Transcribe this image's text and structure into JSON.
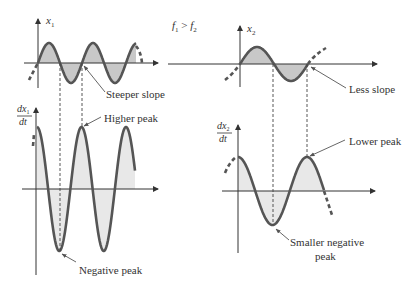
{
  "figure": {
    "condition": {
      "text_f1": "f",
      "sub1": "1",
      "op": " > ",
      "text_f2": "f",
      "sub2": "2"
    },
    "colors": {
      "curve": "#555555",
      "fill_top": "#c8c8c8",
      "fill_bottom": "#e8e8e8",
      "axis": "#333333"
    },
    "panels": {
      "x1": {
        "var": "x",
        "sub": "1"
      },
      "dx1": {
        "num": "dx",
        "sub": "1",
        "den": "dt"
      },
      "x2": {
        "var": "x",
        "sub": "2"
      },
      "dx2": {
        "num": "dx",
        "sub": "2",
        "den": "dt"
      }
    },
    "annotations": {
      "steeper_slope": "Steeper slope",
      "higher_peak": "Higher peak",
      "negative_peak": "Negative peak",
      "less_slope": "Less slope",
      "lower_peak": "Lower peak",
      "smaller_negative_line1": "Smaller negative",
      "smaller_negative_line2": "peak"
    }
  },
  "chart_data": [
    {
      "type": "line",
      "title": "x1 (higher frequency f1)",
      "function": "sine",
      "relative_amplitude": 1.0,
      "relative_frequency": 2.0,
      "cycles_shown": 2.5,
      "series": [
        {
          "name": "x1",
          "shape": "sin"
        }
      ]
    },
    {
      "type": "line",
      "title": "dx1/dt",
      "function": "cosine",
      "relative_amplitude": 3.0,
      "relative_frequency": 2.0,
      "cycles_shown": 2.25,
      "annotations": [
        "Higher peak",
        "Negative peak"
      ]
    },
    {
      "type": "line",
      "title": "x2 (lower frequency f2)",
      "function": "sine",
      "relative_amplitude": 0.85,
      "relative_frequency": 1.0,
      "cycles_shown": 1.0,
      "annotations": [
        "Less slope"
      ]
    },
    {
      "type": "line",
      "title": "dx2/dt",
      "function": "cosine",
      "relative_amplitude": 1.6,
      "relative_frequency": 1.0,
      "cycles_shown": 1.25,
      "annotations": [
        "Lower peak",
        "Smaller negative peak"
      ]
    }
  ]
}
